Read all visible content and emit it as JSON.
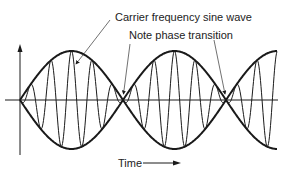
{
  "labels": {
    "carrier": "Carrier frequency sine wave",
    "phase": "Note phase transition",
    "time": "Time"
  },
  "colors": {
    "line": "#1a1a1a",
    "background": "#ffffff"
  },
  "geometry": {
    "axis_x": 20,
    "axis_y": 100,
    "envelope_amplitude": 49,
    "envelope_period_px": 206,
    "carrier_period_px": 20.6,
    "x_end": 277
  }
}
